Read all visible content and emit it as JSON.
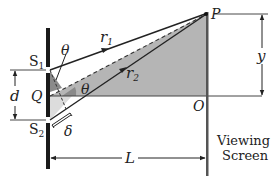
{
  "diagram": {
    "labels": {
      "s1": "S",
      "s1_sub": "1",
      "s2": "S",
      "s2_sub": "2",
      "q": "Q",
      "o": "O",
      "p": "P",
      "r1": "r",
      "r1_sub": "1",
      "r2": "r",
      "r2_sub": "2",
      "theta_top": "θ",
      "theta_mid": "θ",
      "d": "d",
      "delta": "δ",
      "y": "y",
      "L": "L",
      "screen_line1": "Viewing",
      "screen_line2": "Screen"
    },
    "colors": {
      "shade_dark": "#8a8a8a",
      "shade_mid": "#b5b5b5",
      "shade_light": "#d9d9d9",
      "line": "#222222",
      "barrier": "#1a1a1a",
      "screen": "#555555"
    }
  }
}
